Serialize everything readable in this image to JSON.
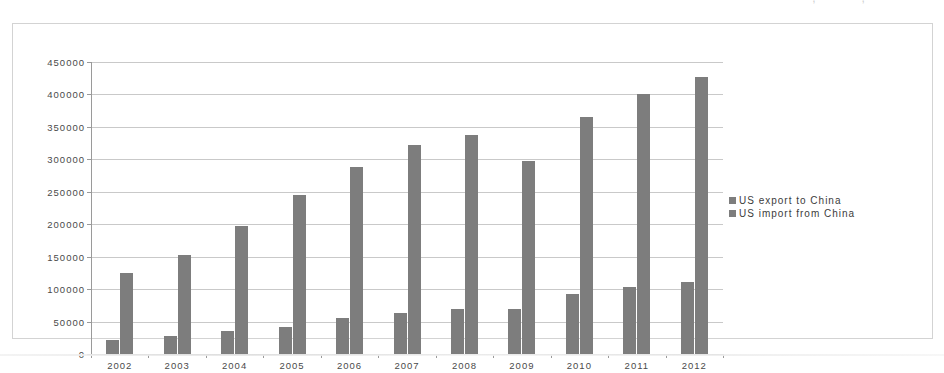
{
  "page": {
    "top_clipped_text": "\" — — , — — ,"
  },
  "legend": {
    "entries": [
      {
        "label": "US export to China",
        "color": "#7d7d7d",
        "marker": "legend-swatch"
      },
      {
        "label": "US import from China",
        "color": "#7d7d7d",
        "marker": "legend-swatch"
      }
    ]
  },
  "axis": {
    "y_ticks": [
      "450000",
      "400000",
      "350000",
      "300000",
      "250000",
      "200000",
      "150000",
      "100000",
      "50000",
      "0"
    ],
    "x_ticks": [
      "2002",
      "2003",
      "2004",
      "2005",
      "2006",
      "2007",
      "2008",
      "2009",
      "2010",
      "2011",
      "2012"
    ]
  },
  "chart_data": {
    "type": "bar",
    "title": "",
    "xlabel": "",
    "ylabel": "",
    "ylim": [
      0,
      450000
    ],
    "ytick_step": 50000,
    "grid": true,
    "legend_position": "right",
    "categories": [
      "2002",
      "2003",
      "2004",
      "2005",
      "2006",
      "2007",
      "2008",
      "2009",
      "2010",
      "2011",
      "2012"
    ],
    "series": [
      {
        "name": "US export to China",
        "color": "#7d7d7d",
        "values": [
          22000,
          28000,
          35000,
          42000,
          55000,
          63000,
          70000,
          69000,
          92000,
          104000,
          111000
        ]
      },
      {
        "name": "US import from China",
        "color": "#7d7d7d",
        "values": [
          125000,
          152000,
          197000,
          245000,
          288000,
          322000,
          338000,
          297000,
          365000,
          400000,
          427000
        ]
      }
    ]
  }
}
